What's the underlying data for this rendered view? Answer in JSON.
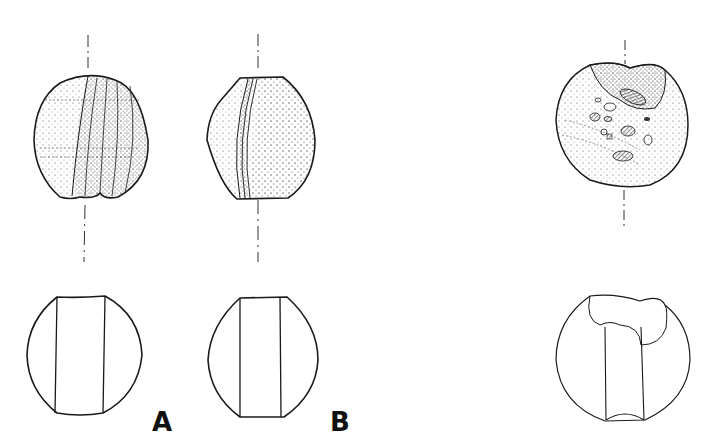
{
  "figure": {
    "type": "archaeological bead drawings",
    "labels": {
      "a": "A",
      "b": "B"
    },
    "panels": [
      {
        "id": "A-side-view",
        "view": "exterior, ribbed/melon bead with stippling"
      },
      {
        "id": "B-side-view",
        "view": "exterior, bead with banded edge and stippling"
      },
      {
        "id": "C-exterior",
        "view": "exterior, bead with inclusions and damaged perforation"
      },
      {
        "id": "A-section",
        "view": "cross-section with straight perforation"
      },
      {
        "id": "B-section",
        "view": "cross-section with straight perforation"
      },
      {
        "id": "C-section",
        "view": "cross-section with irregular perforation"
      }
    ],
    "colors": {
      "ink": "#1a1a1a",
      "background": "#ffffff"
    }
  }
}
